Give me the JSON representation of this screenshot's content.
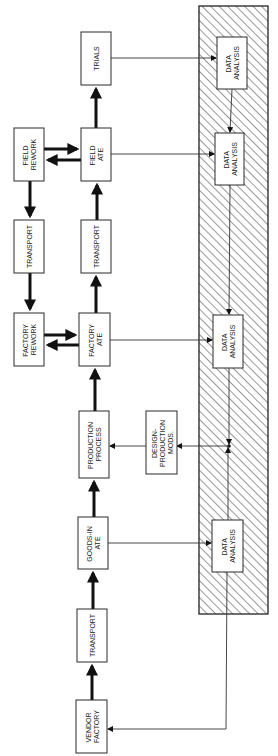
{
  "diagram": {
    "orientation": "rotated-90-clockwise",
    "colors": {
      "line": "#111111",
      "box_fill": "#ffffff",
      "hatch": "#333333",
      "background": "#ffffff"
    },
    "region": {
      "label": "data-analysis-hatched-region",
      "pattern": "diagonal-hatch"
    },
    "boxes": {
      "trials": {
        "lines": [
          "TRIALS"
        ]
      },
      "field_rework": {
        "lines": [
          "FIELD",
          "REWORK"
        ]
      },
      "field_ate": {
        "lines": [
          "FIELD",
          "ATE"
        ]
      },
      "transport_left": {
        "lines": [
          "TRANSPORT"
        ]
      },
      "transport_right": {
        "lines": [
          "TRANSPORT"
        ]
      },
      "factory_rework": {
        "lines": [
          "FACTORY",
          "REWORK"
        ]
      },
      "factory_ate": {
        "lines": [
          "FACTORY",
          "ATE"
        ]
      },
      "production_process": {
        "lines": [
          "PRODUCTION",
          "PROCESS"
        ]
      },
      "design_mods": {
        "lines": [
          "DESIGN-",
          "PRODUCTION",
          "MODS."
        ]
      },
      "goods_in_ate": {
        "lines": [
          "GOODS-IN",
          "ATE"
        ]
      },
      "transport_bottom": {
        "lines": [
          "TRANSPORT"
        ]
      },
      "vendor_factory": {
        "lines": [
          "VENDOR",
          "FACTORY"
        ]
      },
      "data_analysis_1": {
        "lines": [
          "DATA",
          "ANALYSIS"
        ]
      },
      "data_analysis_2": {
        "lines": [
          "DATA",
          "ANALYSIS"
        ]
      },
      "data_analysis_3": {
        "lines": [
          "DATA",
          "ANALYSIS"
        ]
      },
      "data_analysis_4": {
        "lines": [
          "DATA",
          "ANALYSIS"
        ]
      }
    },
    "flows": [
      "VENDOR FACTORY -> TRANSPORT",
      "TRANSPORT -> GOODS-IN ATE",
      "GOODS-IN ATE -> PRODUCTION PROCESS",
      "PRODUCTION PROCESS -> FACTORY ATE",
      "FACTORY ATE <-> FACTORY REWORK",
      "FACTORY ATE -> TRANSPORT",
      "TRANSPORT -> FIELD ATE",
      "FIELD REWORK -> TRANSPORT -> FACTORY REWORK",
      "FIELD ATE <-> FIELD REWORK",
      "FIELD ATE -> TRIALS",
      "TRIALS -> DATA ANALYSIS",
      "FIELD ATE -> DATA ANALYSIS",
      "FACTORY ATE -> DATA ANALYSIS",
      "GOODS-IN ATE -> DATA ANALYSIS",
      "DATA ANALYSIS -> DESIGN-PRODUCTION MODS.",
      "DESIGN-PRODUCTION MODS. -> PRODUCTION PROCESS",
      "DATA ANALYSIS -> VENDOR FACTORY"
    ]
  }
}
